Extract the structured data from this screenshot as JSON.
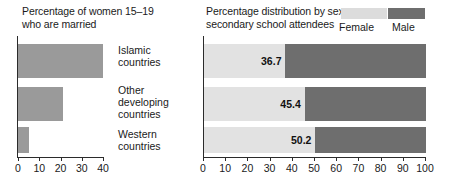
{
  "chart_data": [
    {
      "type": "bar",
      "title": "Percentage of women 15–19\nwho are married",
      "orientation": "horizontal",
      "categories": [
        "Islamic\ncountries",
        "Other\ndeveloping\ncountries",
        "Western\ncountries"
      ],
      "values": [
        40,
        21,
        5
      ],
      "xlabel": "",
      "ylabel": "",
      "xlim": [
        0,
        40
      ],
      "xticks": [
        0,
        10,
        20,
        30,
        40
      ],
      "xticklabels": [
        "0",
        "10",
        "20",
        "30",
        "40"
      ],
      "grid": false,
      "bar_color": "#9a9a9a"
    },
    {
      "type": "bar",
      "subtype": "stacked-100",
      "title": "Percentage distribution by sex,\nsecondary school attendees",
      "orientation": "horizontal",
      "categories": [
        "Islamic\ncountries",
        "Other\ndeveloping\ncountries",
        "Western\ncountries"
      ],
      "series": [
        {
          "name": "Female",
          "values": [
            36.7,
            45.4,
            50.2
          ],
          "color": "#e2e2e2"
        },
        {
          "name": "Male",
          "values": [
            63.3,
            54.6,
            49.8
          ],
          "color": "#6e6e6e"
        }
      ],
      "data_labels": [
        "36.7",
        "45.4",
        "50.2"
      ],
      "xlabel": "",
      "ylabel": "",
      "xlim": [
        0,
        100
      ],
      "xticks": [
        0,
        10,
        20,
        30,
        40,
        50,
        60,
        70,
        80,
        90,
        100
      ],
      "xticklabels": [
        "0",
        "10",
        "20",
        "30",
        "40",
        "50",
        "60",
        "70",
        "80",
        "90",
        "100"
      ],
      "grid": false,
      "legend_position": "top-right",
      "legend": [
        "Female",
        "Male"
      ]
    }
  ],
  "left": {
    "title": "Percentage of women 15–19\nwho are married",
    "ticklabels": [
      "0",
      "10",
      "20",
      "30",
      "40"
    ]
  },
  "right": {
    "title": "Percentage distribution by sex,\nsecondary school attendees",
    "ticklabels": [
      "0",
      "10",
      "20",
      "30",
      "40",
      "50",
      "60",
      "70",
      "80",
      "90",
      "100"
    ],
    "legend": {
      "female_label": "Female",
      "male_label": "Male"
    },
    "values": [
      "36.7",
      "45.4",
      "50.2"
    ]
  },
  "categories": [
    "Islamic\ncountries",
    "Other\ndeveloping\ncountries",
    "Western\ncountries"
  ],
  "colors": {
    "female": "#e2e2e2",
    "male": "#6e6e6e",
    "left_bar": "#9a9a9a",
    "axis": "#2b2b2b",
    "text": "#1a1a1a",
    "background": "#ffffff"
  }
}
